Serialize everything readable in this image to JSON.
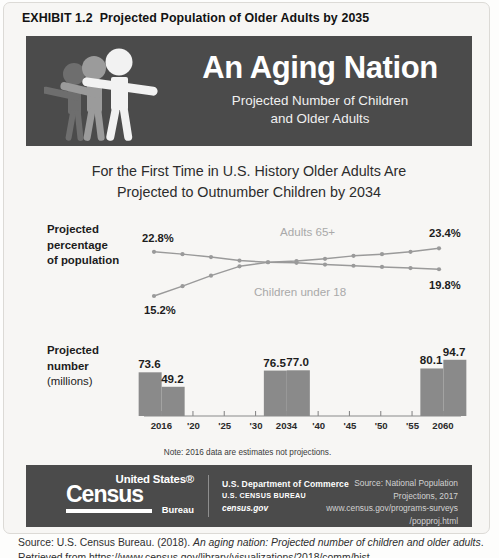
{
  "exhibit": {
    "label": "EXHIBIT 1.2",
    "title": "Projected Population of Older Adults by 2035"
  },
  "hero": {
    "title": "An Aging Nation",
    "subtitle_line1": "Projected Number of Children",
    "subtitle_line2": "and Older Adults",
    "band_color": "#4b4b4b",
    "figure_colors": [
      "#6e6e6e",
      "#9b9b9b",
      "#f2f2f2"
    ]
  },
  "headline": {
    "line1": "For the First Time in U.S. History Older Adults Are",
    "line2": "Projected to Outnumber Children by 2034"
  },
  "line_section": {
    "axis_label_line1": "Projected",
    "axis_label_line2": "percentage",
    "axis_label_line3": "of population",
    "start_label_adults": "22.8%",
    "end_label_adults": "23.4%",
    "start_label_children": "15.2%",
    "end_label_children": "19.8%",
    "series_label_adults": "Adults 65+",
    "series_label_children": "Children under 18"
  },
  "bar_section": {
    "axis_label_line1": "Projected",
    "axis_label_line2": "number",
    "axis_label_line3": "(millions)",
    "note": "Note: 2016 data are estimates not projections.",
    "tick_labels": [
      "2016",
      "'20",
      "'25",
      "'30",
      "2034",
      "'40",
      "'45",
      "'50",
      "'55",
      "2060"
    ],
    "value_labels": [
      "49.2",
      "73.6",
      "77.0",
      "76.5",
      "94.7",
      "80.1"
    ]
  },
  "footer": {
    "logo_top": "United States®",
    "logo_main": "Census",
    "logo_bottom": "Bureau",
    "dept_line1": "U.S. Department of Commerce",
    "dept_line2": "U.S. CENSUS BUREAU",
    "dept_line3": "census.gov",
    "source_line1": "Source: National Population",
    "source_line2": "Projections, 2017",
    "source_line3": "www.census.gov/programs-surveys",
    "source_line4": "/popproj.html"
  },
  "citation": {
    "prefix": "Source: U.S. Census Bureau. (2018). ",
    "italic": "An aging nation: Projected number of children and older adults",
    "suffix": ". Retrieved from https://www.census.gov/library/visualizations/2018/comm/hist-"
  },
  "chart_data": [
    {
      "type": "line",
      "title": "Projected percentage of population",
      "xlabel": "",
      "ylabel": "Projected percentage of population",
      "ylim": [
        14,
        25
      ],
      "grid": false,
      "legend": "inline-annotations",
      "x": [
        2016,
        2020,
        2025,
        2030,
        2034,
        2035,
        2040,
        2045,
        2050,
        2055,
        2060
      ],
      "series": [
        {
          "name": "Children under 18",
          "color": "#9a9a9a",
          "values": [
            22.8,
            22.4,
            21.9,
            21.3,
            21.0,
            20.9,
            20.6,
            20.4,
            20.2,
            20.0,
            19.8
          ],
          "start_label": "22.8%",
          "end_label": "19.8%"
        },
        {
          "name": "Adults 65+",
          "color": "#9a9a9a",
          "values": [
            15.2,
            16.9,
            18.7,
            20.3,
            21.0,
            21.2,
            21.6,
            22.1,
            22.4,
            22.8,
            23.4
          ],
          "start_label": "15.2%",
          "end_label": "23.4%"
        }
      ],
      "annotations": [
        "Adults 65+",
        "Children under 18"
      ]
    },
    {
      "type": "bar",
      "title": "Projected number (millions)",
      "xlabel": "",
      "ylabel": "Projected number (millions)",
      "ylim": [
        0,
        100
      ],
      "grid": false,
      "categories": [
        "2016",
        "'20",
        "'25",
        "'30",
        "2034",
        "'40",
        "'45",
        "'50",
        "'55",
        "2060"
      ],
      "bars": [
        {
          "year": "2016",
          "group": "Children under 18",
          "value": 73.6
        },
        {
          "year": "2016",
          "group": "Adults 65+",
          "value": 49.2
        },
        {
          "year": "2034",
          "group": "Children under 18",
          "value": 76.5
        },
        {
          "year": "2034",
          "group": "Adults 65+",
          "value": 77.0
        },
        {
          "year": "2060",
          "group": "Children under 18",
          "value": 80.1
        },
        {
          "year": "2060",
          "group": "Adults 65+",
          "value": 94.7
        }
      ],
      "bar_color": "#8a8a8a",
      "note": "Note: 2016 data are estimates not projections."
    }
  ]
}
